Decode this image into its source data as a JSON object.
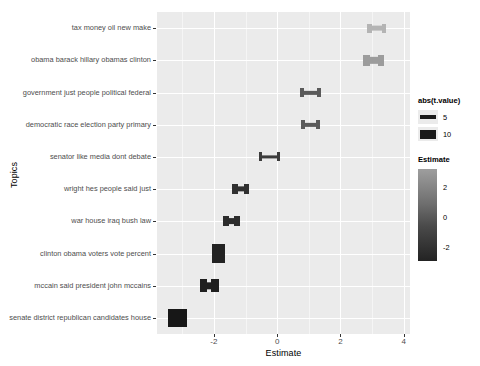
{
  "chart_data": {
    "type": "bar",
    "chart_style": "horizontal-error-bar-crossbar",
    "title": "",
    "xlabel": "Estimate",
    "ylabel": "Topics",
    "xlim": [
      -3.8,
      4.2
    ],
    "ylim": [
      0,
      10
    ],
    "grid": true,
    "panel_background": "#EBEBEB",
    "gridline_color": "#FFFFFF",
    "x_ticks": [
      -2,
      0,
      2,
      4
    ],
    "x_tick_labels": [
      "-2",
      "0",
      "2",
      "4"
    ],
    "x_minor_ticks": [
      -3,
      -1,
      1,
      3
    ],
    "categories": [
      "tax money oil new make",
      "obama barack hillary obamas clinton",
      "government just people political federal",
      "democratic race election party primary",
      "senator like media dont debate",
      "wright hes people said just",
      "war house iraq bush law",
      "clinton obama voters vote percent",
      "mccain said president john mccains",
      "senate district republican candidates house"
    ],
    "points": [
      {
        "topic": "tax money oil new make",
        "estimate": 3.15,
        "ci_low": 2.85,
        "ci_high": 3.45,
        "abs_t_value": 5.0,
        "color": "#B4B4B4"
      },
      {
        "topic": "obama barack hillary obamas clinton",
        "estimate": 3.05,
        "ci_low": 2.72,
        "ci_high": 3.38,
        "abs_t_value": 6.5,
        "color": "#9C9C9C"
      },
      {
        "topic": "government just people political federal",
        "estimate": 1.05,
        "ci_low": 0.72,
        "ci_high": 1.38,
        "abs_t_value": 4.5,
        "color": "#5A5A5A"
      },
      {
        "topic": "democratic race election party primary",
        "estimate": 1.05,
        "ci_low": 0.74,
        "ci_high": 1.36,
        "abs_t_value": 4.5,
        "color": "#5A5A5A"
      },
      {
        "topic": "senator like media dont debate",
        "estimate": -0.25,
        "ci_low": -0.58,
        "ci_high": 0.08,
        "abs_t_value": 3.5,
        "color": "#3C3C3C"
      },
      {
        "topic": "wright hes people said just",
        "estimate": -1.15,
        "ci_low": -1.42,
        "ci_high": -0.88,
        "abs_t_value": 5.5,
        "color": "#303030"
      },
      {
        "topic": "war house iraq bush law",
        "estimate": -1.45,
        "ci_low": -1.72,
        "ci_high": -1.18,
        "abs_t_value": 6.0,
        "color": "#2C2C2C"
      },
      {
        "topic": "clinton obama voters vote percent",
        "estimate": -1.85,
        "ci_low": -2.05,
        "ci_high": -1.65,
        "abs_t_value": 11.0,
        "color": "#232323"
      },
      {
        "topic": "mccain said president john mccains",
        "estimate": -2.15,
        "ci_low": -2.45,
        "ci_high": -1.85,
        "abs_t_value": 7.5,
        "color": "#1F1F1F"
      },
      {
        "topic": "senate district republican candidates house",
        "estimate": -3.15,
        "ci_low": -3.45,
        "ci_high": -2.85,
        "abs_t_value": 10.0,
        "color": "#171717"
      }
    ]
  },
  "legends": {
    "size": {
      "title": "abs(t.value)",
      "items": [
        {
          "label": "5",
          "thickness": 4
        },
        {
          "label": "10",
          "thickness": 9
        }
      ]
    },
    "color": {
      "title": "Estimate",
      "ticks": [
        "2",
        "0",
        "-2"
      ],
      "high_color": "#9E9E9E",
      "low_color": "#232323"
    }
  }
}
